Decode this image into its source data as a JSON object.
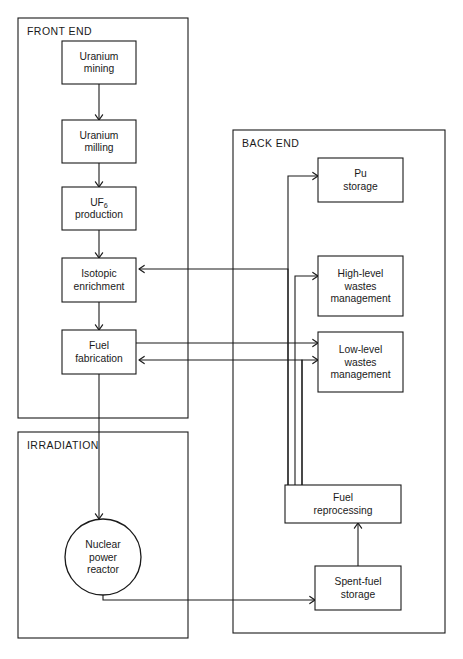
{
  "diagram": {
    "background_color": "#ffffff",
    "line_color": "#1a1a1a",
    "groups": [
      {
        "id": "front-end",
        "label": "FRONT END",
        "x": 18,
        "y": 18,
        "w": 170,
        "h": 400
      },
      {
        "id": "back-end",
        "label": "BACK END",
        "x": 233,
        "y": 130,
        "w": 212,
        "h": 503
      },
      {
        "id": "irradiation",
        "label": "IRRADIATION",
        "x": 18,
        "y": 432,
        "w": 170,
        "h": 206
      }
    ],
    "nodes": [
      {
        "id": "uranium-mining",
        "shape": "rect",
        "line1": "Uranium",
        "line2": "mining",
        "x": 62,
        "y": 41,
        "w": 74,
        "h": 43
      },
      {
        "id": "uranium-milling",
        "shape": "rect",
        "line1": "Uranium",
        "line2": "milling",
        "x": 62,
        "y": 120,
        "w": 74,
        "h": 43
      },
      {
        "id": "uf6-production",
        "shape": "rect",
        "line1": "UF6",
        "line2": "production",
        "x": 62,
        "y": 187,
        "w": 74,
        "h": 43,
        "subscript": "6",
        "base": "UF"
      },
      {
        "id": "isotopic-enrichment",
        "shape": "rect",
        "line1": "Isotopic",
        "line2": "enrichment",
        "x": 62,
        "y": 258,
        "w": 74,
        "h": 44
      },
      {
        "id": "fuel-fabrication",
        "shape": "rect",
        "line1": "Fuel",
        "line2": "fabrication",
        "x": 62,
        "y": 330,
        "w": 74,
        "h": 44
      },
      {
        "id": "nuclear-power-reactor",
        "shape": "circle",
        "line1": "Nuclear",
        "line2": "power",
        "line3": "reactor",
        "cx": 103,
        "cy": 557,
        "r": 38
      },
      {
        "id": "pu-storage",
        "shape": "rect",
        "line1": "Pu",
        "line2": "storage",
        "x": 318,
        "y": 158,
        "w": 85,
        "h": 44
      },
      {
        "id": "high-level-wastes",
        "shape": "rect",
        "line1": "High-level",
        "line2": "wastes",
        "line3": "management",
        "x": 318,
        "y": 256,
        "w": 85,
        "h": 60
      },
      {
        "id": "low-level-wastes",
        "shape": "rect",
        "line1": "Low-level",
        "line2": "wastes",
        "line3": "management",
        "x": 318,
        "y": 332,
        "w": 85,
        "h": 60
      },
      {
        "id": "fuel-reprocessing",
        "shape": "rect",
        "line1": "Fuel",
        "line2": "reprocessing",
        "x": 285,
        "y": 485,
        "w": 116,
        "h": 38
      },
      {
        "id": "spent-fuel-storage",
        "shape": "rect",
        "line1": "Spent-fuel",
        "line2": "storage",
        "x": 315,
        "y": 566,
        "w": 86,
        "h": 44
      }
    ],
    "edges": [
      {
        "id": "mining-to-milling",
        "from": "uranium-mining",
        "to": "uranium-milling",
        "path": "M 99,84 L 99,120",
        "arrow": "down",
        "ax": 99,
        "ay": 120
      },
      {
        "id": "milling-to-uf6",
        "from": "uranium-milling",
        "to": "uf6-production",
        "path": "M 99,163 L 99,187",
        "arrow": "down",
        "ax": 99,
        "ay": 187
      },
      {
        "id": "uf6-to-enrichment",
        "from": "uf6-production",
        "to": "isotopic-enrichment",
        "path": "M 99,230 L 99,258",
        "arrow": "down",
        "ax": 99,
        "ay": 258
      },
      {
        "id": "enrichment-to-fabrication",
        "from": "isotopic-enrichment",
        "to": "fuel-fabrication",
        "path": "M 99,302 L 99,330",
        "arrow": "down",
        "ax": 99,
        "ay": 330
      },
      {
        "id": "fabrication-to-reactor",
        "from": "fuel-fabrication",
        "to": "nuclear-power-reactor",
        "path": "M 99,374 L 99,519",
        "arrow": "down",
        "ax": 99,
        "ay": 519
      },
      {
        "id": "reprocessing-to-enrichment",
        "from": "fuel-reprocessing",
        "to": "isotopic-enrichment",
        "path": "M 288,485 L 288,269 L 139,269",
        "arrow": "left",
        "ax": 139,
        "ay": 269
      },
      {
        "id": "reprocessing-to-fabrication",
        "from": "fuel-reprocessing",
        "to": "fuel-fabrication",
        "path": "M 302,485 L 302,360 L 139,360",
        "arrow": "left",
        "ax": 139,
        "ay": 360
      },
      {
        "id": "reprocessing-to-pu-storage",
        "from": "fuel-reprocessing",
        "to": "pu-storage",
        "path": "M 288,485 L 288,176 L 318,176",
        "arrow": "right",
        "ax": 318,
        "ay": 176
      },
      {
        "id": "reprocessing-to-high-level",
        "from": "fuel-reprocessing",
        "to": "high-level-wastes",
        "path": "M 295,485 L 295,276 L 318,276",
        "arrow": "right",
        "ax": 318,
        "ay": 276
      },
      {
        "id": "reprocessing-to-low-level",
        "from": "fuel-reprocessing",
        "to": "low-level-wastes",
        "path": "M 302,485 L 302,360 L 318,360",
        "arrow": "right",
        "ax": 318,
        "ay": 360
      },
      {
        "id": "fabrication-to-low-level",
        "from": "fuel-fabrication",
        "to": "low-level-wastes",
        "path": "M 136,343 L 318,343",
        "arrow": "right",
        "ax": 318,
        "ay": 343
      },
      {
        "id": "reactor-to-spent-fuel",
        "from": "nuclear-power-reactor",
        "to": "spent-fuel-storage",
        "path": "M 103,595 L 103,600 L 315,600",
        "arrow": "right",
        "ax": 315,
        "ay": 600
      },
      {
        "id": "spent-fuel-to-reprocessing",
        "from": "spent-fuel-storage",
        "to": "fuel-reprocessing",
        "path": "M 358,566 L 358,523",
        "arrow": "up",
        "ax": 358,
        "ay": 523
      }
    ]
  }
}
